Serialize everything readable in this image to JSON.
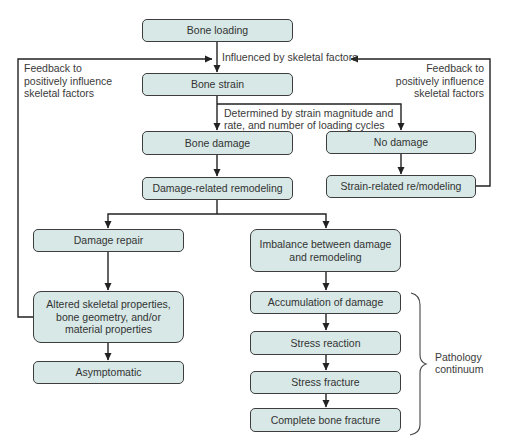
{
  "nodes": {
    "bone_loading": "Bone loading",
    "bone_strain": "Bone strain",
    "bone_damage": "Bone damage",
    "no_damage": "No damage",
    "damage_remodeling": "Damage-related remodeling",
    "strain_remodeling": "Strain-related re/modeling",
    "damage_repair": "Damage repair",
    "imbalance_l1": "Imbalance between damage",
    "imbalance_l2": "and remodeling",
    "altered_l1": "Altered skeletal properties,",
    "altered_l2": "bone geometry, and/or",
    "altered_l3": "material properties",
    "asymptomatic": "Asymptomatic",
    "accumulation": "Accumulation of damage",
    "stress_reaction": "Stress reaction",
    "stress_fracture": "Stress fracture",
    "complete_fracture": "Complete bone fracture"
  },
  "annotations": {
    "influenced": "Influenced by skeletal factors",
    "determined_l1": "Determined by strain magnitude and",
    "determined_l2": "rate, and number of loading cycles",
    "feedback_left_l1": "Feedback to",
    "feedback_left_l2": "positively influence",
    "feedback_left_l3": "skeletal factors",
    "feedback_right_l1": "Feedback to",
    "feedback_right_l2": "positively influence",
    "feedback_right_l3": "skeletal factors",
    "pathology_l1": "Pathology",
    "pathology_l2": "continuum"
  },
  "colors": {
    "box_fill": "#d7e8e6",
    "box_border": "#3d3d3d",
    "line": "#222222"
  }
}
